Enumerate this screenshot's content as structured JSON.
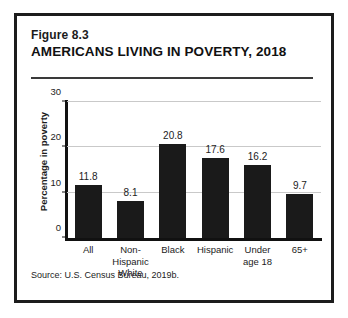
{
  "figure": {
    "number": "Figure 8.3",
    "title": "AMERICANS LIVING IN POVERTY, 2018",
    "source": "Source:  U.S. Census Bureau, 2019b.",
    "border_color": "#1c1c1c",
    "bar_color": "#1a1a1a",
    "gridline_color": "#c9c9c9"
  },
  "chart_data": {
    "type": "bar",
    "title": "AMERICANS LIVING IN POVERTY, 2018",
    "xlabel": "",
    "ylabel": "Percentage in poverty",
    "ylim": [
      0,
      30
    ],
    "yticks": [
      0,
      10,
      20,
      30
    ],
    "ytick_labels": [
      "0",
      "10",
      "20",
      "30"
    ],
    "grid": true,
    "legend": false,
    "categories": [
      "All",
      "Non-\nHispanic\nWhite",
      "Black",
      "Hispanic",
      "Under\nage 18",
      "65+"
    ],
    "category_lines": [
      [
        "All"
      ],
      [
        "Non-",
        "Hispanic",
        "White"
      ],
      [
        "Black"
      ],
      [
        "Hispanic"
      ],
      [
        "Under",
        "age 18"
      ],
      [
        "65+"
      ]
    ],
    "values": [
      11.8,
      8.1,
      20.8,
      17.6,
      16.2,
      9.7
    ],
    "value_labels": [
      "11.8",
      "8.1",
      "20.8",
      "17.6",
      "16.2",
      "9.7"
    ],
    "series": [
      {
        "name": "Percentage in poverty",
        "values": [
          11.8,
          8.1,
          20.8,
          17.6,
          16.2,
          9.7
        ]
      }
    ]
  }
}
